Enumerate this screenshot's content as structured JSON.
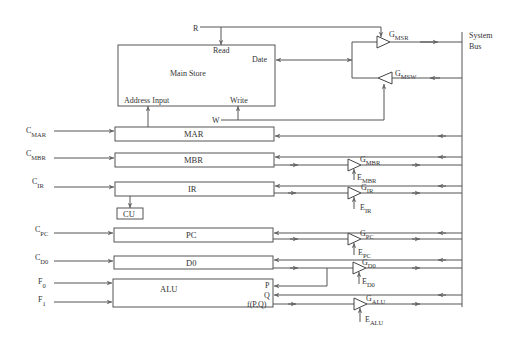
{
  "diagram": {
    "system_bus": {
      "label_line1": "System",
      "label_line2": "Bus"
    },
    "main_store": {
      "label": "Main Store",
      "read_label": "Read",
      "data_label": "Date",
      "address_label": "Address Input",
      "write_label": "Write",
      "r_label": "R",
      "w_label": "W"
    },
    "gates": {
      "msr": {
        "main": "G",
        "sub": "MSR"
      },
      "msw": {
        "main": "G",
        "sub": "MSW"
      },
      "mbr": {
        "main": "G",
        "sub": "MBR"
      },
      "ir": {
        "main": "G",
        "sub": "IR"
      },
      "pc": {
        "main": "G",
        "sub": "PC"
      },
      "d0": {
        "main": "G",
        "sub": "D0"
      },
      "alu": {
        "main": "G",
        "sub": "ALU"
      }
    },
    "enables": {
      "mbr": {
        "main": "E",
        "sub": "MBR"
      },
      "ir": {
        "main": "E",
        "sub": "IR"
      },
      "pc": {
        "main": "E",
        "sub": "PC"
      },
      "d0": {
        "main": "E",
        "sub": "D0"
      },
      "alu": {
        "main": "E",
        "sub": "ALU"
      }
    },
    "registers": {
      "mar": "MAR",
      "mbr": "MBR",
      "ir": "IR",
      "cu": "CU",
      "pc": "PC",
      "d0": "D0",
      "alu": "ALU"
    },
    "controls": {
      "c_mar": {
        "main": "C",
        "sub": "MAR"
      },
      "c_mbr": {
        "main": "C",
        "sub": "MBR"
      },
      "c_ir": {
        "main": "C",
        "sub": "IR"
      },
      "c_pc": {
        "main": "C",
        "sub": "PC"
      },
      "c_d0": {
        "main": "C",
        "sub": "D0"
      },
      "f0": {
        "main": "F",
        "sub": "0"
      },
      "f1": {
        "main": "F",
        "sub": "1"
      }
    },
    "alu_ports": {
      "p": "P",
      "q": "Q",
      "f": "f(P,Q)"
    }
  }
}
